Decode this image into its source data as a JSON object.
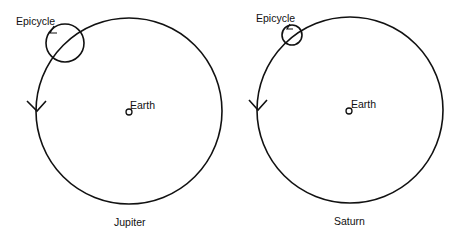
{
  "diagrams": [
    {
      "name": "Jupiter",
      "caption": "Jupiter",
      "epicycle_label": "Epicycle",
      "center_label": "Earth",
      "deferent": {
        "cx": 129,
        "cy": 111,
        "r": 93
      },
      "epicycle": {
        "cx": 65,
        "cy": 43,
        "r": 19
      }
    },
    {
      "name": "Saturn",
      "caption": "Saturn",
      "epicycle_label": "Epicycle",
      "center_label": "Earth",
      "deferent": {
        "cx": 350,
        "cy": 110,
        "r": 93
      },
      "epicycle": {
        "cx": 292,
        "cy": 35,
        "r": 10
      }
    }
  ]
}
